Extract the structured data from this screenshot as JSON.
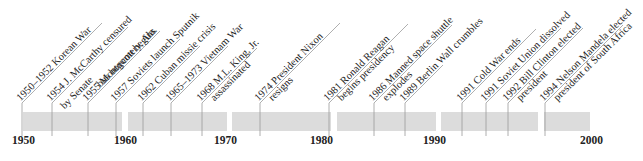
{
  "timeline": {
    "start_year": 1950,
    "end_year": 2000,
    "axis_years": [
      "1950",
      "1960",
      "1970",
      "1980",
      "1990",
      "2000"
    ],
    "bar_color": "#dcdcdc",
    "line_color": "#9a9a9a",
    "events": [
      {
        "year": 1950,
        "line1": "1950–1952 Korean War",
        "line2": ""
      },
      {
        "year": 1954,
        "line1": "1954 J. McCarthy censured",
        "line2": "by Senate"
      },
      {
        "year": 1955,
        "line1": "1955 Montgomery, Ala.",
        "line2": "bus boycott begins"
      },
      {
        "year": 1957,
        "line1": "1957 Soviets launch Sputnik",
        "line2": ""
      },
      {
        "year": 1962,
        "line1": "1962 Cuban missie crisis",
        "line2": ""
      },
      {
        "year": 1965,
        "line1": "1965–1973 Vietnam War",
        "line2": ""
      },
      {
        "year": 1968,
        "line1": "1968 M.L. King, Jr.",
        "line2": "assassinated"
      },
      {
        "year": 1974,
        "line1": "1974 President Nixon",
        "line2": "resigns"
      },
      {
        "year": 1981,
        "line1": "1981 Ronald Reagan",
        "line2": "begins presidency"
      },
      {
        "year": 1986,
        "line1": "1986 Manned space shuttle",
        "line2": "explodes"
      },
      {
        "year": 1989,
        "line1": "1989 Berlin Wall crumbles",
        "line2": ""
      },
      {
        "year": 1991,
        "line1": "1991 Cold War ends",
        "line2": ""
      },
      {
        "year": 1991,
        "line1": "1991 Soviet Union dissolved",
        "line2": ""
      },
      {
        "year": 1992,
        "line1": "1992 Bill Clinton elected",
        "line2": "president"
      },
      {
        "year": 1994,
        "line1": "1994 Nelson Mandela elected",
        "line2": "president of South Africa"
      }
    ]
  }
}
